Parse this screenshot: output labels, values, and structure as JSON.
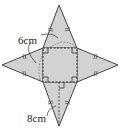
{
  "diagram": {
    "type": "square-pyramid-net",
    "labels": {
      "base_edge": "6cm",
      "slant_height": "8cm"
    },
    "colors": {
      "fill": "#d2d2d2",
      "stroke": "#444444"
    }
  }
}
